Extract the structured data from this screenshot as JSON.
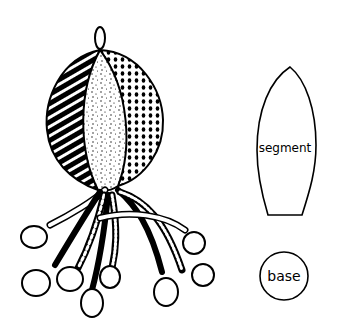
{
  "figure": {
    "colors": {
      "ink": "#000000",
      "paper": "#ffffff"
    }
  },
  "pieces": {
    "segment": {
      "label": "segment"
    },
    "base": {
      "label": "base"
    }
  }
}
